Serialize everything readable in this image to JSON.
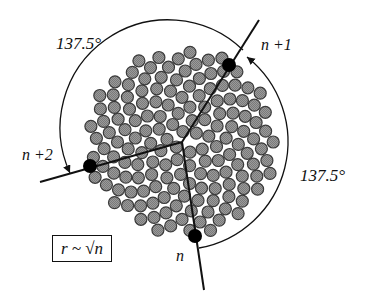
{
  "diagram": {
    "divergence_angle_top": "137.5°",
    "divergence_angle_right": "137.5°",
    "seeds": [
      {
        "id": "n",
        "label": "n",
        "x": 195,
        "y": 236,
        "line_end": [
          204,
          290
        ]
      },
      {
        "id": "n+1",
        "label": "n +1",
        "x": 229,
        "y": 65,
        "line_end": [
          259,
          20
        ]
      },
      {
        "id": "n+2",
        "label": "n +2",
        "x": 90,
        "y": 166,
        "line_end": [
          40,
          182
        ]
      }
    ],
    "center": [
      182,
      142
    ],
    "formula": "r ~ √n",
    "colors": {
      "floret_fill": "#8c8c8c",
      "floret_stroke": "#3a3a3a",
      "seed": "#000000",
      "line": "#111111"
    }
  }
}
